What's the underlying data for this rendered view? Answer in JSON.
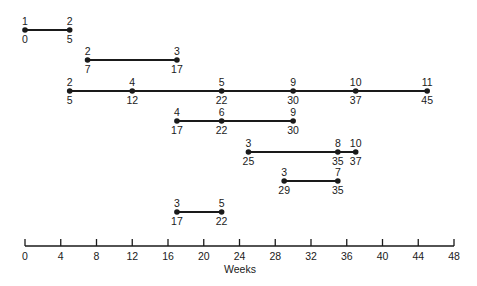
{
  "diagram": {
    "type": "network-timeline",
    "axis": {
      "label": "Weeks",
      "min": 0,
      "max": 48,
      "ticks": [
        0,
        4,
        8,
        12,
        16,
        20,
        24,
        28,
        32,
        36,
        40,
        44,
        48
      ]
    },
    "chains": [
      {
        "nodes": [
          {
            "id": "1",
            "week": 0
          },
          {
            "id": "2",
            "week": 5
          }
        ]
      },
      {
        "nodes": [
          {
            "id": "2",
            "week": 7
          },
          {
            "id": "3",
            "week": 17
          }
        ]
      },
      {
        "nodes": [
          {
            "id": "2",
            "week": 5
          },
          {
            "id": "4",
            "week": 12
          },
          {
            "id": "5",
            "week": 22
          },
          {
            "id": "9",
            "week": 30
          },
          {
            "id": "10",
            "week": 37
          },
          {
            "id": "11",
            "week": 45
          }
        ]
      },
      {
        "nodes": [
          {
            "id": "4",
            "week": 17
          },
          {
            "id": "6",
            "week": 22
          },
          {
            "id": "9",
            "week": 30
          }
        ]
      },
      {
        "nodes": [
          {
            "id": "3",
            "week": 25
          },
          {
            "id": "8",
            "week": 35
          },
          {
            "id": "10",
            "week": 37
          }
        ]
      },
      {
        "nodes": [
          {
            "id": "3",
            "week": 29
          },
          {
            "id": "7",
            "week": 35
          }
        ]
      },
      {
        "nodes": [
          {
            "id": "3",
            "week": 17
          },
          {
            "id": "5",
            "week": 22
          }
        ]
      }
    ],
    "colors": {
      "ink": "#1a1a1a",
      "background": "#ffffff"
    }
  }
}
